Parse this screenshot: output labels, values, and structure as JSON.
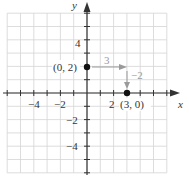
{
  "chart_data": {
    "type": "scatter",
    "title": "",
    "xlabel": "x",
    "ylabel": "y",
    "xlim": [
      -6,
      6
    ],
    "ylim": [
      -6,
      6
    ],
    "grid": true,
    "x_tick_labels": [
      "−4",
      "−2",
      "2"
    ],
    "y_tick_labels": [
      "4",
      "−2",
      "−4"
    ],
    "points": [
      {
        "x": 0,
        "y": 2,
        "label": "(0, 2)"
      },
      {
        "x": 3,
        "y": 0,
        "label": "(3, 0)"
      }
    ],
    "annotations": [
      {
        "type": "arrow",
        "from": [
          0,
          2
        ],
        "to": [
          3,
          2
        ],
        "label": "3",
        "color": "#9a9a9a"
      },
      {
        "type": "arrow",
        "from": [
          3,
          2
        ],
        "to": [
          3,
          0
        ],
        "label": "−2",
        "color": "#9a9a9a"
      }
    ]
  },
  "labels": {
    "x_axis": "x",
    "y_axis": "y",
    "tick_x_neg4": "−4",
    "tick_x_neg2": "−2",
    "tick_x_2": "2",
    "tick_y_4": "4",
    "tick_y_neg2": "−2",
    "tick_y_neg4": "−4",
    "point_a": "(0, 2)",
    "point_b": "(3, 0)",
    "run_label": "3",
    "rise_label": "−2"
  },
  "colors": {
    "grid": "#d4d4d4",
    "axis": "#333333",
    "annotation": "#9a9a9a",
    "point": "#111111"
  }
}
